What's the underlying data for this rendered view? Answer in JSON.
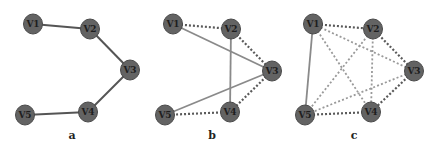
{
  "figure": {
    "colors": {
      "node_fill": "#636363",
      "node_stroke": "#4a4a4a",
      "solid_edge_a": "#555555",
      "solid_edge_bc": "#8a8a8a",
      "dotted_edge": "#5a5a5a",
      "dotted_edge_light": "#9a9a9a"
    },
    "panels": [
      {
        "label": "a",
        "label_pos": [
          72,
          139
        ],
        "nodes": [
          {
            "id": "V1",
            "x": 33,
            "y": 24
          },
          {
            "id": "V2",
            "x": 90,
            "y": 29
          },
          {
            "id": "V3",
            "x": 130,
            "y": 70
          },
          {
            "id": "V4",
            "x": 88,
            "y": 112
          },
          {
            "id": "V5",
            "x": 25,
            "y": 115
          }
        ],
        "edges": [
          {
            "from": "V1",
            "to": "V2",
            "style": "solid"
          },
          {
            "from": "V2",
            "to": "V3",
            "style": "solid"
          },
          {
            "from": "V3",
            "to": "V4",
            "style": "solid"
          },
          {
            "from": "V4",
            "to": "V5",
            "style": "solid"
          }
        ]
      },
      {
        "label": "b",
        "label_pos": [
          212,
          139
        ],
        "nodes": [
          {
            "id": "V1",
            "x": 173,
            "y": 24
          },
          {
            "id": "V2",
            "x": 231,
            "y": 29
          },
          {
            "id": "V3",
            "x": 272,
            "y": 71
          },
          {
            "id": "V4",
            "x": 230,
            "y": 112
          },
          {
            "id": "V5",
            "x": 165,
            "y": 115
          }
        ],
        "edges": [
          {
            "from": "V1",
            "to": "V2",
            "style": "dotted"
          },
          {
            "from": "V2",
            "to": "V3",
            "style": "dotted"
          },
          {
            "from": "V3",
            "to": "V4",
            "style": "dotted"
          },
          {
            "from": "V4",
            "to": "V5",
            "style": "dotted"
          },
          {
            "from": "V1",
            "to": "V3",
            "style": "solid"
          },
          {
            "from": "V2",
            "to": "V4",
            "style": "solid"
          },
          {
            "from": "V3",
            "to": "V5",
            "style": "solid"
          }
        ]
      },
      {
        "label": "c",
        "label_pos": [
          354,
          139
        ],
        "nodes": [
          {
            "id": "V1",
            "x": 313,
            "y": 24
          },
          {
            "id": "V2",
            "x": 373,
            "y": 29
          },
          {
            "id": "V3",
            "x": 414,
            "y": 71
          },
          {
            "id": "V4",
            "x": 371,
            "y": 112
          },
          {
            "id": "V5",
            "x": 305,
            "y": 115
          }
        ],
        "edges": [
          {
            "from": "V1",
            "to": "V2",
            "style": "dotted"
          },
          {
            "from": "V2",
            "to": "V3",
            "style": "dotted"
          },
          {
            "from": "V3",
            "to": "V4",
            "style": "dotted"
          },
          {
            "from": "V4",
            "to": "V5",
            "style": "dotted"
          },
          {
            "from": "V1",
            "to": "V3",
            "style": "dotted-light"
          },
          {
            "from": "V1",
            "to": "V4",
            "style": "dotted-light"
          },
          {
            "from": "V2",
            "to": "V4",
            "style": "dotted-light"
          },
          {
            "from": "V2",
            "to": "V5",
            "style": "dotted-light"
          },
          {
            "from": "V3",
            "to": "V5",
            "style": "dotted-light"
          },
          {
            "from": "V1",
            "to": "V5",
            "style": "solid"
          }
        ]
      }
    ]
  }
}
